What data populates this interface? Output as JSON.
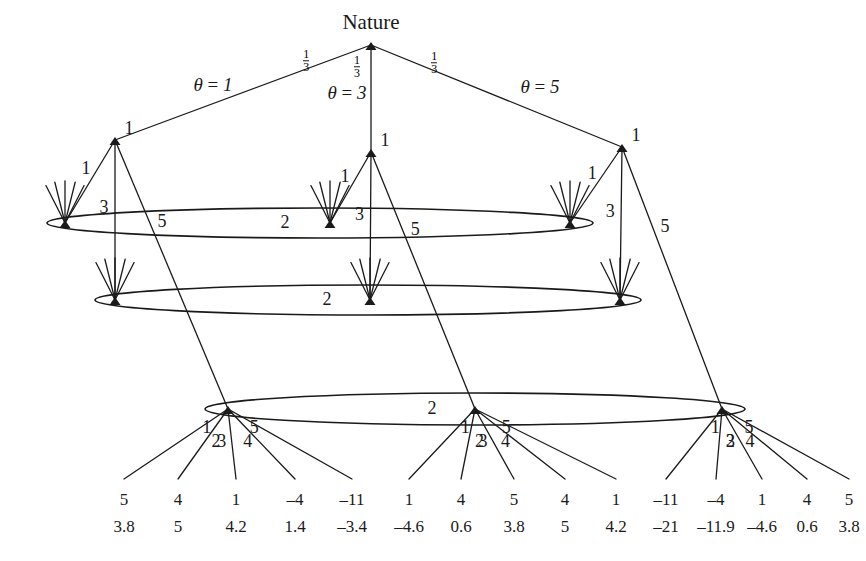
{
  "figure": {
    "type": "extensive-form-game-tree",
    "root_label": "Nature",
    "line_color": "#1a1a1a",
    "background": "#ffffff"
  },
  "nature": {
    "label": "Nature",
    "x": 371,
    "y": 45,
    "branches": [
      {
        "id": "left",
        "prob": "1/3",
        "prob_num": "1",
        "prob_den": "3",
        "theta_label": "θ = 1",
        "theta_value": 1,
        "child_x": 115,
        "child_y": 140
      },
      {
        "id": "middle",
        "prob": "1/3",
        "prob_num": "1",
        "prob_den": "3",
        "theta_label": "θ = 3",
        "theta_value": 3,
        "child_x": 371,
        "child_y": 152
      },
      {
        "id": "right",
        "prob": "1/3",
        "prob_num": "1",
        "prob_den": "3",
        "theta_label": "θ = 5",
        "theta_value": 5,
        "child_x": 622,
        "child_y": 147
      }
    ]
  },
  "player1_nodes": [
    {
      "id": "p1-left",
      "player_label": "1",
      "x": 115,
      "y": 140,
      "actions": [
        "1",
        "3",
        "5"
      ]
    },
    {
      "id": "p1-middle",
      "player_label": "1",
      "x": 371,
      "y": 152,
      "actions": [
        "1",
        "3",
        "5"
      ]
    },
    {
      "id": "p1-right",
      "player_label": "1",
      "x": 622,
      "y": 147,
      "actions": [
        "1",
        "3",
        "5"
      ]
    }
  ],
  "information_sets": [
    {
      "id": "iset-msg-1",
      "player_label": "2",
      "message": "1",
      "label_x": 285,
      "label_y": 222,
      "ellipse": {
        "cx": 320,
        "cy": 223,
        "rx": 273,
        "ry": 15
      },
      "nodes": [
        {
          "x": 65,
          "y": 223
        },
        {
          "x": 330,
          "y": 223
        },
        {
          "x": 570,
          "y": 223
        }
      ]
    },
    {
      "id": "iset-msg-3",
      "player_label": "2",
      "message": "3",
      "label_x": 327,
      "label_y": 299,
      "ellipse": {
        "cx": 368,
        "cy": 300,
        "rx": 273,
        "ry": 15
      },
      "nodes": [
        {
          "x": 115,
          "y": 300
        },
        {
          "x": 370,
          "y": 300
        },
        {
          "x": 620,
          "y": 300
        }
      ]
    },
    {
      "id": "iset-msg-5",
      "player_label": "2",
      "message": "5",
      "label_x": 432,
      "label_y": 408,
      "ellipse": {
        "cx": 475,
        "cy": 409,
        "rx": 270,
        "ry": 16
      },
      "nodes": [
        {
          "x": 228,
          "y": 409
        },
        {
          "x": 475,
          "y": 409
        },
        {
          "x": 722,
          "y": 409
        }
      ]
    }
  ],
  "decision_actions": [
    "1",
    "2",
    "3",
    "4",
    "5"
  ],
  "terminal_groups": [
    {
      "id": "group-left",
      "node_x": 228,
      "actions": [
        "1",
        "2",
        "3",
        "4",
        "5"
      ],
      "payoffs": [
        {
          "action": "1",
          "top": "5",
          "bottom": "3.8"
        },
        {
          "action": "2",
          "top": "4",
          "bottom": "5"
        },
        {
          "action": "3",
          "top": "1",
          "bottom": "4.2"
        },
        {
          "action": "4",
          "top": "–4",
          "bottom": "1.4"
        },
        {
          "action": "5",
          "top": "–11",
          "bottom": "–3.4"
        }
      ]
    },
    {
      "id": "group-middle",
      "node_x": 475,
      "actions": [
        "1",
        "2",
        "3",
        "4",
        "5"
      ],
      "payoffs": [
        {
          "action": "1",
          "top": "1",
          "bottom": "–4.6"
        },
        {
          "action": "2",
          "top": "4",
          "bottom": "0.6"
        },
        {
          "action": "3",
          "top": "5",
          "bottom": "3.8"
        },
        {
          "action": "4",
          "top": "4",
          "bottom": "5"
        },
        {
          "action": "5",
          "top": "1",
          "bottom": "4.2"
        }
      ]
    },
    {
      "id": "group-right",
      "node_x": 722,
      "actions": [
        "1",
        "2",
        "3",
        "4",
        "5"
      ],
      "payoffs": [
        {
          "action": "1",
          "top": "–11",
          "bottom": "–21"
        },
        {
          "action": "2",
          "top": "–4",
          "bottom": "–11.9"
        },
        {
          "action": "3",
          "top": "1",
          "bottom": "–4.6"
        },
        {
          "action": "4",
          "top": "4",
          "bottom": "0.6"
        },
        {
          "action": "5",
          "top": "5",
          "bottom": "3.8"
        }
      ]
    }
  ],
  "payoff_columns_x": [
    124,
    178,
    236,
    295,
    352,
    409,
    461,
    514,
    565,
    616,
    666,
    716,
    762,
    807,
    849
  ],
  "payoff_rows_y": {
    "top": 500,
    "bottom": 527
  }
}
